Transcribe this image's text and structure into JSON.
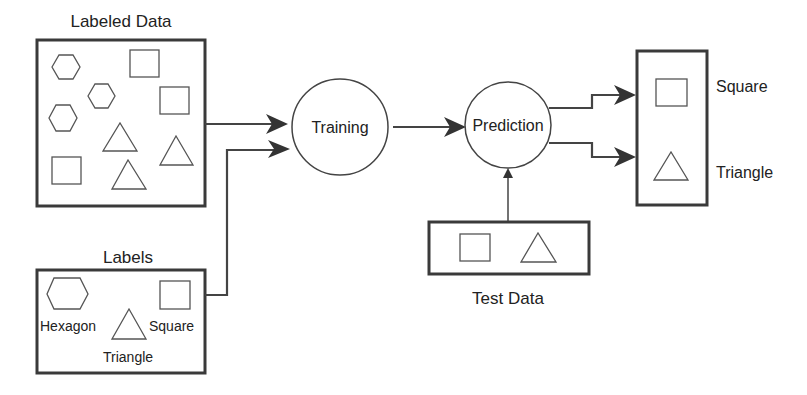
{
  "diagram": {
    "labeled_data": {
      "title": "Labeled Data",
      "shapes": [
        "hexagon",
        "hexagon",
        "hexagon",
        "square",
        "square",
        "square",
        "triangle",
        "triangle",
        "triangle"
      ]
    },
    "labels": {
      "title": "Labels",
      "items": [
        {
          "shape": "hexagon",
          "label": "Hexagon"
        },
        {
          "shape": "triangle",
          "label": "Triangle"
        },
        {
          "shape": "square",
          "label": "Square"
        }
      ]
    },
    "training": {
      "label": "Training"
    },
    "prediction": {
      "label": "Prediction"
    },
    "test_data": {
      "title": "Test Data",
      "shapes": [
        "square",
        "triangle"
      ]
    },
    "output": {
      "items": [
        {
          "shape": "square",
          "label": "Square"
        },
        {
          "shape": "triangle",
          "label": "Triangle"
        }
      ]
    },
    "edges": [
      {
        "from": "Labeled Data",
        "to": "Training"
      },
      {
        "from": "Labels",
        "to": "Training"
      },
      {
        "from": "Training",
        "to": "Prediction"
      },
      {
        "from": "Test Data",
        "to": "Prediction"
      },
      {
        "from": "Prediction",
        "to": "Square"
      },
      {
        "from": "Prediction",
        "to": "Triangle"
      }
    ]
  }
}
